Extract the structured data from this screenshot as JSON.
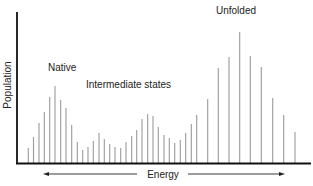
{
  "chart_data": {
    "type": "bar",
    "title": "",
    "xlabel": "Energy",
    "ylabel": "Population",
    "grid": false,
    "legend": null,
    "x_axis_arrows": [
      "left",
      "right"
    ],
    "annotations": [
      {
        "text": "Native",
        "x": 48,
        "y": 71
      },
      {
        "text": "Intermediate states",
        "x": 86,
        "y": 88
      },
      {
        "text": "Unfolded",
        "x": 216,
        "y": 14
      }
    ],
    "x": [
      28.3,
      33.5,
      39,
      44.3,
      49.7,
      55,
      60.7,
      66,
      71.7,
      77.3,
      82.7,
      88,
      93.3,
      99,
      104.3,
      109.7,
      115,
      120.7,
      126,
      131.7,
      136.7,
      142,
      147.7,
      153,
      158.3,
      164,
      169.3,
      174.7,
      180.3,
      185.7,
      191.3,
      196.7,
      207.7,
      218.3,
      229,
      239.7,
      250.3,
      261.3,
      272.7,
      283.7,
      295
    ],
    "values": [
      15,
      26,
      40,
      51,
      66,
      77,
      63,
      55,
      38,
      21,
      13,
      16,
      22,
      30,
      24,
      19,
      16,
      15,
      21,
      27,
      33,
      44,
      49,
      47,
      36,
      28,
      25,
      20,
      23,
      30,
      39,
      48,
      64,
      95,
      106,
      131,
      107,
      96,
      65,
      48,
      31
    ],
    "units": "relative population (px height above baseline, unlabeled axis)"
  },
  "colors": {
    "bar": "#9a9a9a",
    "axis": "#111111",
    "text": "#222222"
  }
}
